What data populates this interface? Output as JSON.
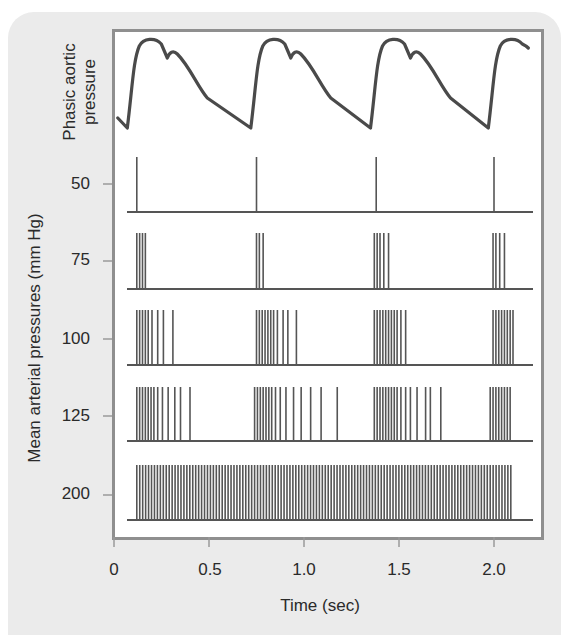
{
  "chart_data": {
    "type": "line",
    "title": "",
    "xlabel": "Time (sec)",
    "ylabel": "Mean arterial pressures (mm Hg)",
    "top_trace_label": "Phasic aortic pressure",
    "x_ticks": [
      "0",
      "0.5",
      "1.0",
      "1.5",
      "2.0"
    ],
    "x_tick_values": [
      0,
      0.5,
      1.0,
      1.5,
      2.0
    ],
    "xlim": [
      0,
      2.2
    ],
    "y_ticks": [
      "50",
      "75",
      "100",
      "125",
      "200"
    ],
    "grid": false,
    "legend": "none",
    "phasic_pressure": {
      "description": "Aortic pressure waveform with rapid systolic upstroke, peak, dicrotic notch, and slow diastolic decline",
      "beat_period_sec": 0.62,
      "upstroke_times_sec": [
        0.07,
        0.72,
        1.35,
        1.97
      ],
      "dicrotic_notch_offset_sec": 0.18
    },
    "series": [
      {
        "name": "50",
        "type": "spike_train",
        "spike_times_sec": [
          0.12,
          0.75,
          1.38,
          2.0
        ]
      },
      {
        "name": "75",
        "type": "spike_train",
        "spike_times_sec": [
          0.12,
          0.135,
          0.15,
          0.165,
          0.75,
          0.765,
          0.785,
          1.37,
          1.385,
          1.4,
          1.42,
          1.445,
          1.995,
          2.01,
          2.03,
          2.055
        ]
      },
      {
        "name": "100",
        "type": "spike_train",
        "spike_times_sec": [
          0.12,
          0.135,
          0.15,
          0.165,
          0.18,
          0.2,
          0.23,
          0.26,
          0.31,
          0.75,
          0.765,
          0.78,
          0.795,
          0.81,
          0.825,
          0.84,
          0.86,
          0.89,
          0.915,
          0.96,
          1.37,
          1.385,
          1.4,
          1.415,
          1.43,
          1.445,
          1.46,
          1.475,
          1.49,
          1.51,
          1.535,
          1.995,
          2.01,
          2.025,
          2.04,
          2.055,
          2.07,
          2.085,
          2.1
        ]
      },
      {
        "name": "125",
        "type": "spike_train",
        "spike_times_sec": [
          0.12,
          0.135,
          0.15,
          0.165,
          0.18,
          0.195,
          0.21,
          0.23,
          0.255,
          0.285,
          0.32,
          0.35,
          0.4,
          0.74,
          0.755,
          0.77,
          0.785,
          0.8,
          0.815,
          0.83,
          0.85,
          0.875,
          0.905,
          0.945,
          0.985,
          1.035,
          1.09,
          1.175,
          1.37,
          1.385,
          1.4,
          1.415,
          1.43,
          1.445,
          1.46,
          1.475,
          1.49,
          1.51,
          1.535,
          1.56,
          1.595,
          1.64,
          1.665,
          1.72,
          1.98,
          1.995,
          2.01,
          2.025,
          2.04,
          2.055,
          2.07,
          2.085
        ]
      },
      {
        "name": "200",
        "type": "spike_train",
        "description": "Continuous high-frequency firing, evenly spaced",
        "spike_interval_sec": 0.0155,
        "start_sec": 0.12,
        "end_sec": 2.1
      }
    ]
  },
  "labels": {
    "top_trace_line1": "Phasic aortic",
    "top_trace_line2": "pressure",
    "ylabel": "Mean arterial pressures (mm Hg)",
    "xlabel": "Time (sec)",
    "y_ticks": [
      "50",
      "75",
      "100",
      "125",
      "200"
    ],
    "x_ticks": [
      "0",
      "0.5",
      "1.0",
      "1.5",
      "2.0"
    ]
  },
  "colors": {
    "trace": "#4a4a4a",
    "spike": "#555555",
    "frame": "#8f8f8f",
    "panel": "#ebebeb",
    "text": "#2a2a2a"
  }
}
